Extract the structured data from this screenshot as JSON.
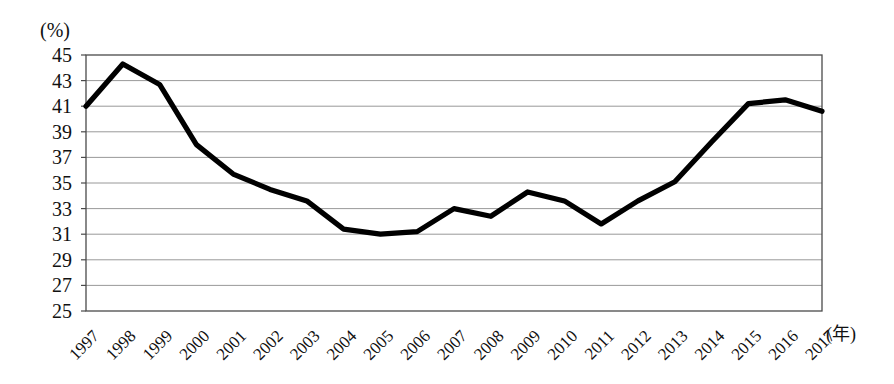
{
  "chart_data": {
    "type": "line",
    "title": "",
    "subtitle": "",
    "xlabel": "(年)",
    "ylabel": "(%)",
    "unit_top_left": "(%)",
    "unit_bottom_right": "(年)",
    "grid": true,
    "legend": "none",
    "xlim": [
      1997,
      2017
    ],
    "ylim": [
      25,
      45
    ],
    "ytick_step": 2,
    "yticks": [
      45,
      43,
      41,
      39,
      37,
      35,
      33,
      31,
      29,
      27,
      25
    ],
    "categories": [
      "1997",
      "1998",
      "1999",
      "2000",
      "2001",
      "2002",
      "2003",
      "2004",
      "2005",
      "2006",
      "2007",
      "2008",
      "2009",
      "2010",
      "2011",
      "2012",
      "2013",
      "2014",
      "2015",
      "2016",
      "2017"
    ],
    "x": [
      1997,
      1998,
      1999,
      2000,
      2001,
      2002,
      2003,
      2004,
      2005,
      2006,
      2007,
      2008,
      2009,
      2010,
      2011,
      2012,
      2013,
      2014,
      2015,
      2016,
      2017
    ],
    "values": [
      41.0,
      44.3,
      42.7,
      38.0,
      35.7,
      34.5,
      33.6,
      31.4,
      31.0,
      31.2,
      33.0,
      32.4,
      34.3,
      33.6,
      31.8,
      33.6,
      35.1,
      38.2,
      41.2,
      41.5,
      40.6
    ],
    "series": [
      {
        "name": "",
        "color": "#000000",
        "values": [
          41.0,
          44.3,
          42.7,
          38.0,
          35.7,
          34.5,
          33.6,
          31.4,
          31.0,
          31.2,
          33.0,
          32.4,
          34.3,
          33.6,
          31.8,
          33.6,
          35.1,
          38.2,
          41.2,
          41.5,
          40.6
        ]
      }
    ],
    "annotations": []
  },
  "layout": {
    "plot_left": 86,
    "plot_top": 55,
    "plot_right": 822,
    "plot_bottom": 311,
    "xtick_label_rotation": -45
  },
  "colors": {
    "line": "#000000",
    "grid": "#8d8d8d",
    "border": "#4a4a4a",
    "background": "#ffffff",
    "text": "#111111"
  }
}
